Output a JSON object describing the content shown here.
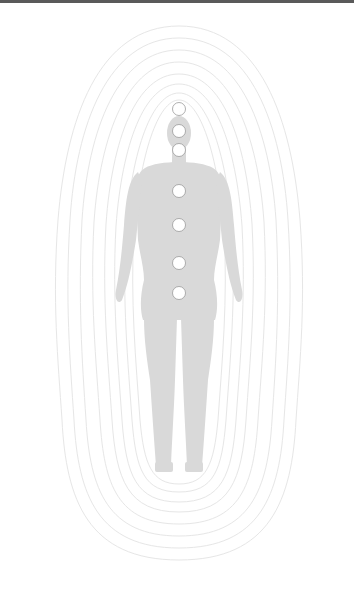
{
  "figure": {
    "silhouette_color": "#d9d9d9",
    "aura_line_color": "#e6e6e6",
    "aura_ring_count": 8,
    "chakra_fill": "#ffffff",
    "chakra_stroke": "#9a9a9a",
    "chakras": [
      {
        "name": "crown",
        "cx": 179,
        "cy": 109
      },
      {
        "name": "third-eye",
        "cx": 179,
        "cy": 131
      },
      {
        "name": "throat",
        "cx": 179,
        "cy": 150
      },
      {
        "name": "heart",
        "cx": 179,
        "cy": 191
      },
      {
        "name": "solar-plexus",
        "cx": 179,
        "cy": 225
      },
      {
        "name": "sacral",
        "cx": 179,
        "cy": 263
      },
      {
        "name": "root",
        "cx": 179,
        "cy": 293
      }
    ]
  },
  "header": {
    "bar_color": "#5a5a5a"
  }
}
